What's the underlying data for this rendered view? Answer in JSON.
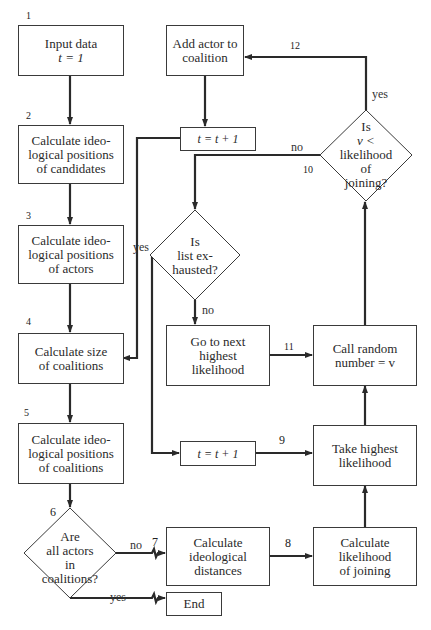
{
  "diagram": {
    "type": "flowchart",
    "nodes": {
      "input": {
        "number": "1",
        "lines": [
          "Input data",
          "t = 1"
        ]
      },
      "candidates": {
        "number": "2",
        "lines": [
          "Calculate ideo-",
          "logical positions",
          "of candidates"
        ]
      },
      "actors": {
        "number": "3",
        "lines": [
          "Calculate ideo-",
          "logical positions",
          "of actors"
        ]
      },
      "size": {
        "number": "4",
        "lines": [
          "Calculate size",
          "of coalitions"
        ]
      },
      "coal_pos": {
        "number": "5",
        "lines": [
          "Calculate ideo-",
          "logical positions",
          "of coalitions"
        ]
      },
      "all_in": {
        "number": "6",
        "lines": [
          "Are",
          "all actors",
          "in",
          "coalitions?"
        ]
      },
      "distances": {
        "number": "7",
        "lines": [
          "Calculate",
          "ideological",
          "distances"
        ]
      },
      "likelihood": {
        "number": "8",
        "lines": [
          "Calculate",
          "likelihood",
          "of joining"
        ]
      },
      "highest": {
        "number": "9",
        "lines": [
          "Take highest",
          "likelihood"
        ]
      },
      "random": {
        "lines": [
          "Call random",
          "number = v"
        ]
      },
      "v_check": {
        "number": "10",
        "lines": [
          "Is",
          "v <",
          "likelihood",
          "of",
          "joining?"
        ]
      },
      "next": {
        "number": "11",
        "lines": [
          "Go to next",
          "highest",
          "likelihood"
        ]
      },
      "add": {
        "number": "12",
        "lines": [
          "Add actor to",
          "coalition"
        ]
      },
      "exhausted": {
        "lines": [
          "Is",
          "list ex-",
          "hausted?"
        ]
      },
      "t_inc_top": {
        "lines": [
          "t = t + 1"
        ]
      },
      "t_inc_bottom": {
        "lines": [
          "t = t + 1"
        ]
      },
      "end": {
        "lines": [
          "End"
        ]
      }
    },
    "edge_labels": {
      "all_in_no": "no",
      "all_in_yes": "yes",
      "v_check_yes": "yes",
      "v_check_no": "no",
      "exhausted_yes": "yes",
      "exhausted_no": "no"
    }
  }
}
